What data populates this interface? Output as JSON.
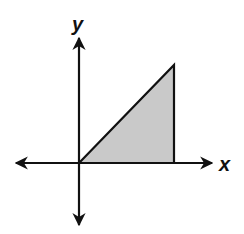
{
  "figure": {
    "width": 244,
    "height": 234,
    "background": "#ffffff"
  },
  "axes": {
    "x_label": "x",
    "y_label": "y",
    "color": "#111111",
    "origin": [
      79,
      163
    ],
    "x_axis": {
      "from": [
        16,
        163
      ],
      "to": [
        212,
        163
      ]
    },
    "y_axis": {
      "from": [
        79,
        38
      ],
      "to": [
        79,
        225
      ]
    }
  },
  "shaded_region": {
    "shape": "right-triangle",
    "fill": "#c9c9c9",
    "stroke": "#111111",
    "vertices": [
      [
        79,
        163
      ],
      [
        174,
        65
      ],
      [
        174,
        163
      ]
    ]
  }
}
